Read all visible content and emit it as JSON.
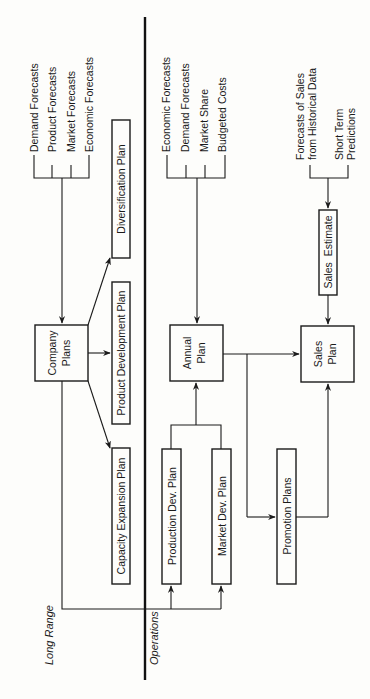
{
  "diagram": {
    "orientation": "rotated 90° counter-clockwise (read bottom-to-top)",
    "sections": {
      "long_range": "Long Range",
      "operations": "Operations"
    },
    "long_range": {
      "inputs": [
        "Demand Forecasts",
        "Product Forecasts",
        "Market Forecasts",
        "Economic Forecasts"
      ],
      "company_plans": {
        "line1": "Company",
        "line2": "Plans"
      },
      "outputs": {
        "diversification": "Diversification Plan",
        "product_development": "Product Development Plan",
        "capacity_expansion": "Capacity Expansion Plan"
      }
    },
    "operations": {
      "annual_inputs": [
        "Economic Forecasts",
        "Demand Forecasts",
        "Market Share",
        "Budgeted Costs"
      ],
      "annual_plan": {
        "line1": "Annual",
        "line2": "Plan"
      },
      "production_dev": "Production Dev. Plan",
      "market_dev": "Market Dev. Plan",
      "promotion": "Promotion Plans",
      "sales_inputs": {
        "historical": {
          "line1": "Forecasts of Sales",
          "line2": "from Historical Data"
        },
        "short_term": {
          "line1": "Short Term",
          "line2": "Predictions"
        }
      },
      "sales_estimate": "Sales  Estimate",
      "sales_plan": {
        "line1": "Sales",
        "line2": "Plan"
      }
    }
  }
}
